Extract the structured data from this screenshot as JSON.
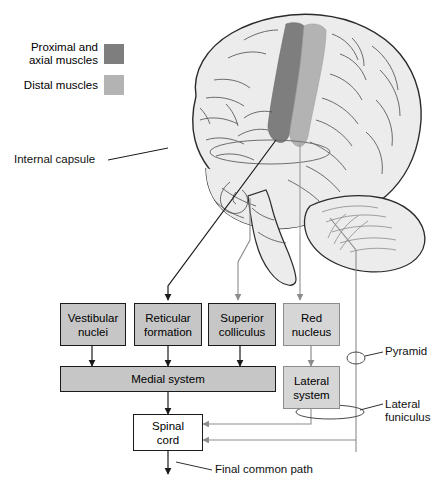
{
  "legend": {
    "items": [
      {
        "label": "Proximal and\naxial muscles",
        "line1": "Proximal and",
        "line2": "axial muscles",
        "swatch": "#7e7e7e",
        "name": "proximal-axial"
      },
      {
        "label": "Distal muscles",
        "line1": "Distal muscles",
        "line2": "",
        "swatch": "#b3b3b3",
        "name": "distal"
      }
    ]
  },
  "annotations": {
    "internal_capsule": "Internal capsule",
    "pyramid": "Pyramid",
    "lateral_funiculus_l1": "Lateral",
    "lateral_funiculus_l2": "funiculus",
    "final_common_path": "Final common path"
  },
  "nodes": [
    {
      "id": "vestibular",
      "line1": "Vestibular",
      "line2": "nuclei",
      "fill": "#c6c6c6",
      "stroke": "#1a1a1a"
    },
    {
      "id": "reticular",
      "line1": "Reticular",
      "line2": "formation",
      "fill": "#c6c6c6",
      "stroke": "#1a1a1a"
    },
    {
      "id": "superior",
      "line1": "Superior",
      "line2": "colliculus",
      "fill": "#c6c6c6",
      "stroke": "#1a1a1a"
    },
    {
      "id": "red",
      "line1": "Red",
      "line2": "nucleus",
      "fill": "#d6d6d6",
      "stroke": "#8c8c8c"
    },
    {
      "id": "medial",
      "line1": "Medial system",
      "line2": "",
      "fill": "#c6c6c6",
      "stroke": "#1a1a1a"
    },
    {
      "id": "lateral",
      "line1": "Lateral",
      "line2": "system",
      "fill": "#d6d6d6",
      "stroke": "#8c8c8c"
    },
    {
      "id": "spinal",
      "line1": "Spinal",
      "line2": "cord",
      "fill": "#ffffff",
      "stroke": "#1a1a1a"
    }
  ],
  "brain": {
    "fill": "#ececec",
    "outline": "#2b2b2b",
    "sulci": "#4a4a4a",
    "motor_strip_proximal": "#7e7e7e",
    "motor_strip_distal": "#b3b3b3"
  },
  "colors": {
    "dark_arrow": "#1a1a1a",
    "light_arrow": "#8c8c8c",
    "page_bg": "#ffffff"
  }
}
